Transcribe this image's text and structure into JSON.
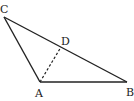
{
  "diagram": {
    "type": "triangle",
    "points": {
      "A": {
        "label": "A",
        "x": 40,
        "y": 82
      },
      "B": {
        "label": "B",
        "x": 127,
        "y": 82
      },
      "C": {
        "label": "C",
        "x": 4,
        "y": 17
      },
      "D": {
        "label": "D",
        "x": 61,
        "y": 47
      }
    },
    "segments": [
      {
        "from": "A",
        "to": "B",
        "style": "solid"
      },
      {
        "from": "B",
        "to": "C",
        "style": "solid"
      },
      {
        "from": "C",
        "to": "A",
        "style": "solid"
      },
      {
        "from": "A",
        "to": "D",
        "style": "dashed"
      }
    ],
    "stroke_color": "#222222"
  }
}
